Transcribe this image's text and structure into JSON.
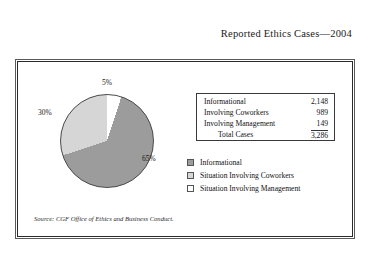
{
  "title": "Reported Ethics Cases—2004",
  "table": {
    "rows": [
      {
        "label": "Informational",
        "value": "2,148"
      },
      {
        "label": "Involving Coworkers",
        "value": "989"
      },
      {
        "label": "Involving Management",
        "value": "149"
      }
    ],
    "total": {
      "label": "Total Cases",
      "value": "3,286"
    }
  },
  "legend": {
    "items": [
      {
        "label": "Informational",
        "color": "#9c9c9c"
      },
      {
        "label": "Situation Involving Coworkers",
        "color": "#d6d6d6"
      },
      {
        "label": "Situation Involving Management",
        "color": "#ffffff"
      }
    ]
  },
  "pie_labels": {
    "informational": "65%",
    "coworkers": "30%",
    "management": "5%"
  },
  "source": "Source: CGF Office of Ethics and Business Conduct.",
  "chart_data": {
    "type": "pie",
    "title": "Reported Ethics Cases—2004",
    "categories": [
      "Informational",
      "Situation Involving Coworkers",
      "Situation Involving Management"
    ],
    "values": [
      2148,
      989,
      149
    ],
    "percentages": [
      65,
      30,
      5
    ],
    "value_labels": [
      "2,148",
      "989",
      "149"
    ],
    "percent_labels": [
      "65%",
      "30%",
      "5%"
    ],
    "colors": [
      "#9c9c9c",
      "#d6d6d6",
      "#ffffff"
    ],
    "total": 3286,
    "total_label": "3,286",
    "legend_position": "right",
    "grid": false,
    "xlabel": "",
    "ylabel": "",
    "source": "Source: CGF Office of Ethics and Business Conduct."
  }
}
